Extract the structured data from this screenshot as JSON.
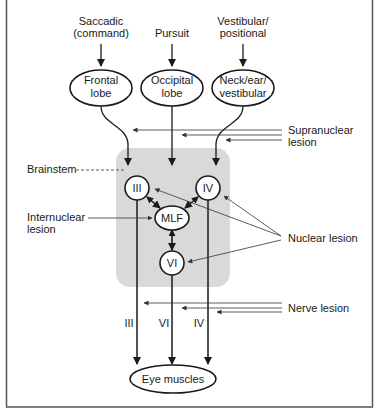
{
  "inputs": [
    {
      "line1": "Saccadic",
      "line2": "(command)"
    },
    {
      "line1": "Pursuit",
      "line2": ""
    },
    {
      "line1": "Vestibular/",
      "line2": "positional"
    }
  ],
  "cortex_nodes": [
    {
      "line1": "Frontal",
      "line2": "lobe"
    },
    {
      "line1": "Occipital",
      "line2": "lobe"
    },
    {
      "line1": "Neck/ear/",
      "line2": "vestibular"
    }
  ],
  "brainstem": {
    "label": "Brainstem",
    "nuclei": {
      "III": "III",
      "IV": "IV",
      "MLF": "MLF",
      "VI": "VI"
    }
  },
  "nerves": [
    "III",
    "VI",
    "IV"
  ],
  "target": "Eye muscles",
  "lesions": {
    "supranuclear": {
      "line1": "Supranuclear",
      "line2": "lesion"
    },
    "internuclear": {
      "line1": "Internuclear",
      "line2": "lesion"
    },
    "nuclear": "Nuclear lesion",
    "nerve": "Nerve lesion"
  },
  "colors": {
    "brainstem_fill": "#d9d9d9",
    "line": "#1a1a1a",
    "frame": "#555555"
  }
}
